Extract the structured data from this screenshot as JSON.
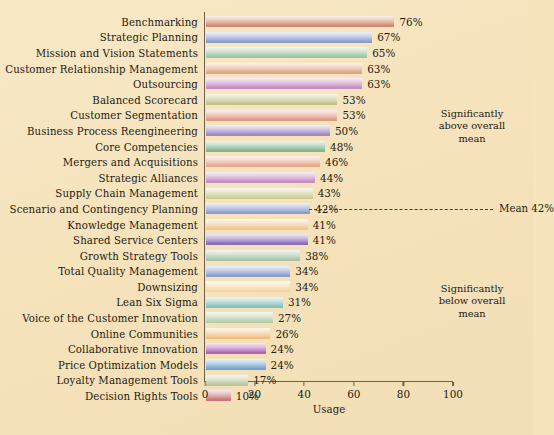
{
  "chart_data": {
    "type": "bar",
    "orientation": "horizontal",
    "title": "",
    "xlabel": "Usage",
    "ylabel": "",
    "xlim": [
      0,
      100
    ],
    "xticks": [
      0,
      20,
      40,
      60,
      80,
      100
    ],
    "grid": false,
    "legend": null,
    "value_suffix": "%",
    "categories": [
      "Benchmarking",
      "Strategic Planning",
      "Mission and Vision Statements",
      "Customer Relationship Management",
      "Outsourcing",
      "Balanced Scorecard",
      "Customer Segmentation",
      "Business Process Reengineering",
      "Core Competencies",
      "Mergers and Acquisitions",
      "Strategic Alliances",
      "Supply Chain Management",
      "Scenario and Contingency Planning",
      "Knowledge Management",
      "Shared Service Centers",
      "Growth Strategy Tools",
      "Total Quality Management",
      "Downsizing",
      "Lean Six Sigma",
      "Voice of the Customer Innovation",
      "Online Communities",
      "Collaborative Innovation",
      "Price Optimization Models",
      "Loyalty Management Tools",
      "Decision Rights Tools"
    ],
    "values": [
      76,
      67,
      65,
      63,
      63,
      53,
      53,
      50,
      48,
      46,
      44,
      43,
      42,
      41,
      41,
      38,
      34,
      34,
      31,
      27,
      26,
      24,
      24,
      17,
      10
    ],
    "value_labels": [
      "76%",
      "67%",
      "65%",
      "63%",
      "63%",
      "53%",
      "53%",
      "50%",
      "48%",
      "46%",
      "44%",
      "43%",
      "42%",
      "41%",
      "41%",
      "38%",
      "34%",
      "34%",
      "31%",
      "27%",
      "26%",
      "24%",
      "24%",
      "17%",
      "10%"
    ],
    "bar_colors": [
      "#cf8a6d",
      "#8a9ccb",
      "#9dc4a4",
      "#e0a583",
      "#c48cc0",
      "#c3c288",
      "#e29882",
      "#9e88c4",
      "#7fb68f",
      "#e6a98e",
      "#c48cc0",
      "#cfcc96",
      "#8a9ccb",
      "#f0c58f",
      "#8a6cb8",
      "#a9c2a6",
      "#8a9ccb",
      "#f2d7a0",
      "#86bfbc",
      "#b6cdad",
      "#f0c083",
      "#b163b5",
      "#6fa3cc",
      "#b8c79a",
      "#cc7477"
    ],
    "annotations": [
      {
        "id": "above-mean",
        "text": "Significantly\nabove overall\nmean"
      },
      {
        "id": "below-mean",
        "text": "Significantly\nbelow overall\nmean"
      },
      {
        "id": "mean-line",
        "text": "Mean 42%",
        "value": 42
      }
    ]
  },
  "annotations": {
    "above_line1": "Significantly",
    "above_line2": "above overall",
    "above_line3": "mean",
    "below_line1": "Significantly",
    "below_line2": "below overall",
    "below_line3": "mean",
    "mean_label": "Mean 42%"
  },
  "axis": {
    "x_title": "Usage"
  },
  "colors": {
    "background": "#f5e2ba",
    "axis": "#6b5f4e",
    "text": "#241a12"
  }
}
